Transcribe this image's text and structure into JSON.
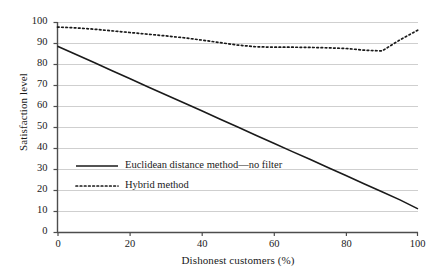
{
  "chart_data": {
    "type": "line",
    "title": "",
    "xlabel": "Dishonest customers (%)",
    "ylabel": "Satisfaction level",
    "xlim": [
      0,
      100
    ],
    "ylim": [
      0,
      100
    ],
    "xticks": [
      "0",
      "20",
      "40",
      "60",
      "80",
      "100"
    ],
    "xtick_values": [
      0,
      20,
      40,
      60,
      80,
      100
    ],
    "yticks": [
      "0",
      "10",
      "20",
      "30",
      "40",
      "50",
      "60",
      "70",
      "80",
      "90",
      "100"
    ],
    "ytick_values": [
      0,
      10,
      20,
      30,
      40,
      50,
      60,
      70,
      80,
      90,
      100
    ],
    "grid": true,
    "grid_axis": "y",
    "legend_position": "center-left",
    "x": [
      0,
      5,
      10,
      15,
      20,
      25,
      30,
      35,
      40,
      45,
      50,
      55,
      60,
      65,
      70,
      75,
      80,
      85,
      90,
      95,
      100
    ],
    "series": [
      {
        "name": "Euclidean distance method—no filter",
        "style": "solid",
        "color": "#1a1a1a",
        "values": [
          88.5,
          84.6,
          80.8,
          76.9,
          73.1,
          69.2,
          65.4,
          61.5,
          57.7,
          53.8,
          50.0,
          46.1,
          42.3,
          38.4,
          34.6,
          30.7,
          26.9,
          23.0,
          19.2,
          15.3,
          11.0
        ]
      },
      {
        "name": "Hybrid method",
        "style": "dotted",
        "color": "#1a1a1a",
        "values": [
          97.6,
          97.2,
          96.6,
          95.8,
          95.0,
          94.2,
          93.4,
          92.5,
          91.4,
          90.2,
          89.0,
          88.2,
          88.0,
          88.0,
          87.9,
          87.7,
          87.4,
          86.6,
          86.2,
          91.5,
          96.2
        ]
      }
    ]
  },
  "legend": {
    "entries": [
      {
        "label": "Euclidean distance method—no filter",
        "style": "solid"
      },
      {
        "label": "Hybrid method",
        "style": "dotted"
      }
    ]
  }
}
